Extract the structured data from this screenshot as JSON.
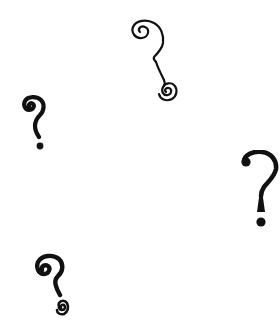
{
  "canvas": {
    "width": 280,
    "height": 332,
    "background": "#ffffff"
  },
  "ink_color": "#111111",
  "marks": [
    {
      "id": "spiral-outline",
      "label": "?",
      "style": "thin outlined spiral hook with spiral dot",
      "x": 128,
      "y": 18,
      "w": 52,
      "h": 86
    },
    {
      "id": "bold-left",
      "label": "?",
      "style": "bold hand-drawn with curl",
      "x": 20,
      "y": 95,
      "w": 30,
      "h": 57
    },
    {
      "id": "bold-right",
      "label": "?",
      "style": "bold serif-like with ball terminal",
      "x": 240,
      "y": 150,
      "w": 40,
      "h": 80
    },
    {
      "id": "spiral-bottom",
      "label": "?",
      "style": "bold curl with spiral dot",
      "x": 33,
      "y": 253,
      "w": 40,
      "h": 64
    }
  ]
}
